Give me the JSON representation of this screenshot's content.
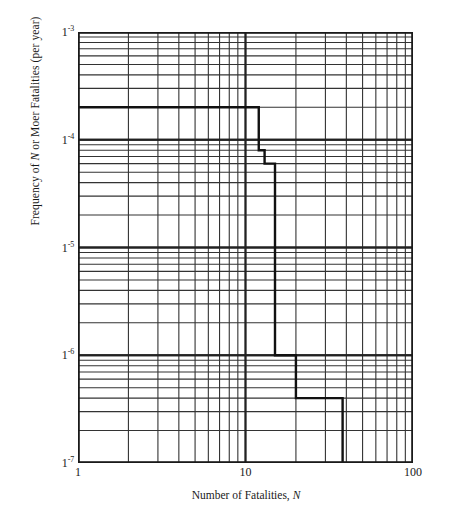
{
  "figure": {
    "type": "log-log-step-chart",
    "background": "#ffffff",
    "line_color": "#111111"
  },
  "axes": {
    "x": {
      "title_prefix": "Number of Fatalities, ",
      "title_italic": "N",
      "scale": "log10",
      "min": 1,
      "max": 100,
      "tick_labels": [
        "1",
        "10",
        "100"
      ],
      "tick_values": [
        1,
        10,
        100
      ]
    },
    "y": {
      "title_part1": "Frequency of ",
      "title_italic": "N",
      "title_part2": " or Moer Fatalities (per year)",
      "scale": "log10",
      "min": 1e-07,
      "max": 0.001,
      "tick_labels": [
        {
          "mantissa": "1",
          "exponent": "-3"
        },
        {
          "mantissa": "1",
          "exponent": "-4"
        },
        {
          "mantissa": "1",
          "exponent": "-5"
        },
        {
          "mantissa": "1",
          "exponent": "-6"
        },
        {
          "mantissa": "1",
          "exponent": "-7"
        }
      ],
      "tick_values": [
        0.001,
        0.0001,
        1e-05,
        1e-06,
        1e-07
      ]
    },
    "grid": {
      "major": true,
      "minor": true,
      "major_color": "#222222",
      "minor_color": "#333333"
    },
    "legend": "none"
  },
  "chart_data": {
    "type": "line",
    "title": "",
    "subtitle": "",
    "xlabel": "Number of Fatalities, N",
    "ylabel": "Frequency of N or Moer Fatalities (per year)",
    "xscale": "log",
    "yscale": "log",
    "xlim": [
      1,
      100
    ],
    "ylim": [
      1e-07,
      0.001
    ],
    "grid": true,
    "legend_position": "none",
    "drawstyle": "steps-post",
    "series": [
      {
        "name": "F-N curve",
        "color": "#111111",
        "x": [
          1,
          12,
          12,
          13,
          13,
          15,
          15,
          20,
          20,
          38,
          38
        ],
        "y": [
          0.0002,
          0.0002,
          8e-05,
          8e-05,
          6e-05,
          6e-05,
          1e-06,
          1e-06,
          4e-07,
          4e-07,
          1e-07
        ]
      }
    ],
    "step_points": [
      {
        "n": 1,
        "frequency": 0.0002
      },
      {
        "n": 12,
        "frequency": 8e-05
      },
      {
        "n": 13,
        "frequency": 6e-05
      },
      {
        "n": 15,
        "frequency": 1e-06
      },
      {
        "n": 20,
        "frequency": 4e-07
      },
      {
        "n": 38,
        "frequency": 1e-07
      }
    ]
  }
}
